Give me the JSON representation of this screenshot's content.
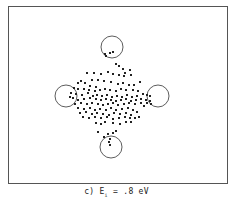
{
  "caption": {
    "prefix": "c) E",
    "subscript": "i",
    "suffix": " = .8 eV"
  },
  "chart_data": {
    "type": "scatter",
    "title": "",
    "xlabel": "",
    "ylabel": "",
    "grid": false,
    "frame": {
      "x": 8,
      "y": 6,
      "width": 219,
      "height": 177,
      "stroke": "#555555"
    },
    "circles": [
      {
        "name": "top",
        "cx": 112,
        "cy": 47,
        "r": 11
      },
      {
        "name": "left",
        "cx": 66,
        "cy": 96,
        "r": 11
      },
      {
        "name": "right",
        "cx": 158,
        "cy": 96,
        "r": 11
      },
      {
        "name": "bottom",
        "cx": 111,
        "cy": 147,
        "r": 11
      }
    ],
    "point_color": "#222222",
    "points": [
      [
        105,
        54
      ],
      [
        110,
        53
      ],
      [
        113,
        52
      ],
      [
        106,
        56
      ],
      [
        116,
        64
      ],
      [
        119,
        66
      ],
      [
        123,
        69
      ],
      [
        130,
        70
      ],
      [
        125,
        73
      ],
      [
        108,
        72
      ],
      [
        101,
        74
      ],
      [
        94,
        73
      ],
      [
        87,
        73
      ],
      [
        113,
        74
      ],
      [
        119,
        75
      ],
      [
        124,
        76
      ],
      [
        131,
        75
      ],
      [
        81,
        81
      ],
      [
        85,
        83
      ],
      [
        78,
        83
      ],
      [
        92,
        80
      ],
      [
        98,
        80
      ],
      [
        104,
        81
      ],
      [
        111,
        82
      ],
      [
        118,
        84
      ],
      [
        123,
        83
      ],
      [
        129,
        85
      ],
      [
        134,
        85
      ],
      [
        140,
        82
      ],
      [
        90,
        86
      ],
      [
        96,
        87
      ],
      [
        74,
        88
      ],
      [
        78,
        89
      ],
      [
        84,
        89
      ],
      [
        89,
        90
      ],
      [
        95,
        91
      ],
      [
        100,
        90
      ],
      [
        105,
        89
      ],
      [
        110,
        90
      ],
      [
        116,
        91
      ],
      [
        121,
        89
      ],
      [
        126,
        90
      ],
      [
        133,
        90
      ],
      [
        138,
        91
      ],
      [
        71,
        93
      ],
      [
        76,
        94
      ],
      [
        82,
        95
      ],
      [
        88,
        93
      ],
      [
        93,
        96
      ],
      [
        97,
        95
      ],
      [
        102,
        96
      ],
      [
        107,
        95
      ],
      [
        112,
        97
      ],
      [
        117,
        96
      ],
      [
        122,
        97
      ],
      [
        127,
        95
      ],
      [
        132,
        97
      ],
      [
        137,
        96
      ],
      [
        143,
        94
      ],
      [
        147,
        95
      ],
      [
        150,
        96
      ],
      [
        70,
        97
      ],
      [
        73,
        98
      ],
      [
        78,
        100
      ],
      [
        84,
        99
      ],
      [
        90,
        98
      ],
      [
        96,
        99
      ],
      [
        101,
        100
      ],
      [
        106,
        99
      ],
      [
        111,
        100
      ],
      [
        116,
        101
      ],
      [
        121,
        100
      ],
      [
        126,
        99
      ],
      [
        131,
        101
      ],
      [
        136,
        100
      ],
      [
        141,
        99
      ],
      [
        146,
        100
      ],
      [
        150,
        101
      ],
      [
        75,
        104
      ],
      [
        81,
        103
      ],
      [
        87,
        104
      ],
      [
        92,
        103
      ],
      [
        98,
        104
      ],
      [
        103,
        105
      ],
      [
        108,
        104
      ],
      [
        113,
        103
      ],
      [
        118,
        105
      ],
      [
        124,
        104
      ],
      [
        129,
        103
      ],
      [
        135,
        104
      ],
      [
        141,
        103
      ],
      [
        147,
        103
      ],
      [
        151,
        104
      ],
      [
        78,
        108
      ],
      [
        84,
        109
      ],
      [
        90,
        108
      ],
      [
        95,
        110
      ],
      [
        100,
        109
      ],
      [
        106,
        110
      ],
      [
        111,
        108
      ],
      [
        116,
        110
      ],
      [
        122,
        109
      ],
      [
        128,
        108
      ],
      [
        133,
        110
      ],
      [
        144,
        106
      ],
      [
        80,
        113
      ],
      [
        86,
        112
      ],
      [
        92,
        114
      ],
      [
        97,
        113
      ],
      [
        103,
        114
      ],
      [
        109,
        115
      ],
      [
        114,
        113
      ],
      [
        120,
        114
      ],
      [
        126,
        113
      ],
      [
        131,
        115
      ],
      [
        137,
        112
      ],
      [
        83,
        117
      ],
      [
        89,
        118
      ],
      [
        95,
        117
      ],
      [
        101,
        118
      ],
      [
        107,
        117
      ],
      [
        113,
        119
      ],
      [
        119,
        118
      ],
      [
        125,
        117
      ],
      [
        130,
        118
      ],
      [
        135,
        118
      ],
      [
        139,
        117
      ],
      [
        96,
        123
      ],
      [
        101,
        124
      ],
      [
        105,
        122
      ],
      [
        113,
        123
      ],
      [
        120,
        124
      ],
      [
        126,
        122
      ],
      [
        131,
        122
      ],
      [
        98,
        132
      ],
      [
        108,
        134
      ],
      [
        113,
        133
      ],
      [
        116,
        131
      ],
      [
        104,
        137
      ],
      [
        110,
        139
      ],
      [
        109,
        142
      ],
      [
        110,
        145
      ]
    ]
  }
}
